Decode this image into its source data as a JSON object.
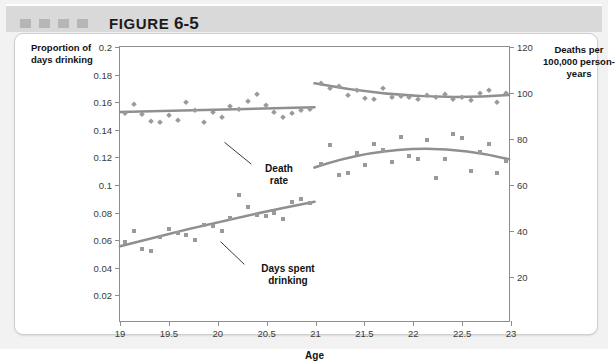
{
  "figure": {
    "label": "FIGURE",
    "number": "6-5",
    "decoration_squares": 4
  },
  "colors": {
    "header_band": "#d9d9d9",
    "square": "#b6b6b6",
    "marker": "#9a9a9a",
    "fit_line": "#8f8f8f",
    "axis": "#8d8d8d"
  },
  "chart_data": {
    "type": "scatter",
    "title": "",
    "xlabel": "Age",
    "ylabel": "Proportion of days drinking",
    "ylabel_right": "Deaths per 100,000 person-years",
    "xlim": [
      19,
      23
    ],
    "ylim": [
      0,
      0.2
    ],
    "ylim_right": [
      0,
      120
    ],
    "grid": false,
    "legend": "none",
    "xticks": [
      19,
      19.5,
      20,
      20.5,
      21,
      21.5,
      22,
      22.5,
      23
    ],
    "xticklabels": [
      "19",
      "19.5",
      "20",
      "20.5",
      "21",
      "21.5",
      "22",
      "22.5",
      "23"
    ],
    "yticks_left": [
      0.02,
      0.04,
      0.06,
      0.08,
      0.1,
      0.12,
      0.14,
      0.16,
      0.18,
      0.2
    ],
    "yticklabels_left": [
      "0.02",
      "0.04",
      "0.06",
      "0.08",
      "0.1",
      "0.12",
      "0.14",
      "0.16",
      "0.18",
      "0.2"
    ],
    "yticks_right": [
      20,
      40,
      60,
      80,
      100,
      120
    ],
    "yticklabels_right": [
      "20",
      "40",
      "60",
      "80",
      "100",
      "120"
    ],
    "annotations": [
      {
        "text": "Death rate",
        "x": 20.45,
        "y": 0.134
      },
      {
        "text": "Days spent drinking",
        "x": 20.45,
        "y": 0.0565
      }
    ],
    "series": [
      {
        "name": "Death rate",
        "axis": "right",
        "marker": "diamond",
        "x": [
          19.05,
          19.14,
          19.23,
          19.32,
          19.41,
          19.5,
          19.59,
          19.68,
          19.77,
          19.86,
          19.95,
          20.04,
          20.13,
          20.22,
          20.31,
          20.4,
          20.49,
          20.58,
          20.67,
          20.76,
          20.85,
          20.94,
          21.06,
          21.15,
          21.24,
          21.33,
          21.42,
          21.51,
          21.6,
          21.69,
          21.78,
          21.87,
          21.96,
          22.05,
          22.14,
          22.23,
          22.32,
          22.41,
          22.5,
          22.59,
          22.68,
          22.77,
          22.86,
          22.95
        ],
        "y": [
          0.1525,
          0.1585,
          0.1515,
          0.1465,
          0.1455,
          0.1505,
          0.147,
          0.16,
          0.154,
          0.1455,
          0.153,
          0.1495,
          0.1575,
          0.155,
          0.161,
          0.166,
          0.158,
          0.153,
          0.149,
          0.152,
          0.1545,
          0.155,
          0.174,
          0.17,
          0.172,
          0.1655,
          0.1685,
          0.163,
          0.1625,
          0.17,
          0.1635,
          0.1645,
          0.164,
          0.1625,
          0.165,
          0.1635,
          0.166,
          0.1625,
          0.164,
          0.1615,
          0.167,
          0.169,
          0.1605,
          0.1665
        ],
        "fit_left": {
          "x0": 19.0,
          "y0": 0.1525,
          "x1": 21.0,
          "y1": 0.156
        },
        "fit_right": {
          "x0": 21.0,
          "y0": 0.1735,
          "xm": 22.0,
          "ym": 0.1645,
          "x1": 23.0,
          "y1": 0.165
        }
      },
      {
        "name": "Days spent drinking",
        "axis": "left",
        "marker": "square",
        "x": [
          19.05,
          19.14,
          19.23,
          19.32,
          19.41,
          19.5,
          19.59,
          19.68,
          19.77,
          19.86,
          19.95,
          20.04,
          20.13,
          20.22,
          20.31,
          20.4,
          20.49,
          20.58,
          20.67,
          20.76,
          20.85,
          20.94,
          21.06,
          21.15,
          21.24,
          21.33,
          21.42,
          21.51,
          21.6,
          21.69,
          21.78,
          21.87,
          21.96,
          22.05,
          22.14,
          22.23,
          22.32,
          22.41,
          22.5,
          22.59,
          22.68,
          22.77,
          22.86,
          22.95
        ],
        "y": [
          0.059,
          0.0665,
          0.0535,
          0.052,
          0.062,
          0.068,
          0.0655,
          0.064,
          0.0605,
          0.071,
          0.07,
          0.0665,
          0.076,
          0.093,
          0.084,
          0.078,
          0.0775,
          0.08,
          0.0755,
          0.088,
          0.09,
          0.087,
          0.115,
          0.129,
          0.1075,
          0.1085,
          0.123,
          0.1145,
          0.13,
          0.1255,
          0.1165,
          0.1345,
          0.121,
          0.119,
          0.1325,
          0.105,
          0.1185,
          0.137,
          0.134,
          0.1105,
          0.124,
          0.1295,
          0.109,
          0.1175
        ],
        "fit_left": {
          "x0": 19.0,
          "y0": 0.0545,
          "xm": 20.0,
          "ym": 0.072,
          "x1": 21.0,
          "y1": 0.087
        },
        "fit_right": {
          "x0": 21.0,
          "y0": 0.112,
          "xm": 22.0,
          "ym": 0.1255,
          "x1": 23.0,
          "y1": 0.118
        }
      }
    ]
  }
}
